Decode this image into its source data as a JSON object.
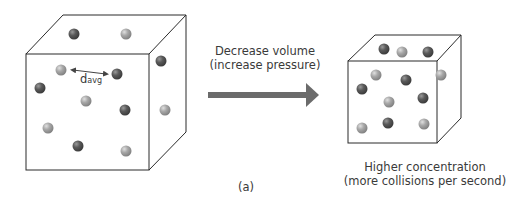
{
  "arrow_label": {
    "line1": "Decrease volume",
    "line2": "(increase pressure)"
  },
  "result_label": {
    "line1": "Higher concentration",
    "line2": "(more collisions per second)"
  },
  "distance_label": {
    "main": "d",
    "subscript": "avg"
  },
  "panel_label": "(a)",
  "colors": {
    "dark_molecule": "#5a5a5a",
    "light_molecule": "#a8a8a8",
    "arrow": "#6b6b6b",
    "cube_edge": "#2a2a2a"
  },
  "left_cube_molecules": [
    {
      "type": "dark",
      "x": 74,
      "y": 34
    },
    {
      "type": "light",
      "x": 126,
      "y": 34
    },
    {
      "type": "dark",
      "x": 161,
      "y": 61
    },
    {
      "type": "light",
      "x": 61,
      "y": 70
    },
    {
      "type": "dark",
      "x": 117,
      "y": 74
    },
    {
      "type": "dark",
      "x": 40,
      "y": 88
    },
    {
      "type": "light",
      "x": 86,
      "y": 101
    },
    {
      "type": "dark",
      "x": 125,
      "y": 110
    },
    {
      "type": "light",
      "x": 165,
      "y": 110
    },
    {
      "type": "light",
      "x": 48,
      "y": 128
    },
    {
      "type": "dark",
      "x": 78,
      "y": 146
    },
    {
      "type": "light",
      "x": 126,
      "y": 151
    }
  ],
  "right_cube_molecules": [
    {
      "type": "dark",
      "x": 384,
      "y": 49
    },
    {
      "type": "light",
      "x": 402,
      "y": 52
    },
    {
      "type": "dark",
      "x": 428,
      "y": 52
    },
    {
      "type": "light",
      "x": 376,
      "y": 75
    },
    {
      "type": "dark",
      "x": 406,
      "y": 80
    },
    {
      "type": "light",
      "x": 441,
      "y": 75
    },
    {
      "type": "dark",
      "x": 362,
      "y": 89
    },
    {
      "type": "light",
      "x": 389,
      "y": 102
    },
    {
      "type": "dark",
      "x": 423,
      "y": 98
    },
    {
      "type": "light",
      "x": 362,
      "y": 128
    },
    {
      "type": "dark",
      "x": 388,
      "y": 123
    },
    {
      "type": "light",
      "x": 424,
      "y": 124
    }
  ]
}
